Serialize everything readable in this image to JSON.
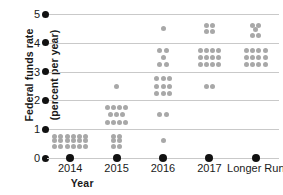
{
  "chart_data": {
    "type": "scatter",
    "title": "",
    "subtitle": "",
    "xlabel": "Year",
    "ylabel": "Federal funds rate (percent per year)",
    "ylabel_line1": "Federal funds rate",
    "ylabel_line2": "(percent per year)",
    "categories": [
      "2014",
      "2015",
      "2016",
      "2017",
      "Longer Run"
    ],
    "ylim": [
      0,
      5
    ],
    "yticks": [
      0,
      1,
      2,
      3,
      4,
      5
    ],
    "ytick_labels": [
      "0",
      "1",
      "2",
      "3",
      "4",
      "5"
    ],
    "grid": true,
    "legend": "none",
    "dot_color": "#a8a8a8",
    "axis_marker_color": "#111111",
    "gridline_color": "#c9c9c9",
    "series": [
      {
        "name": "2014",
        "category_index": 0,
        "rows": [
          {
            "value": 0.75,
            "count": 6
          },
          {
            "value": 0.6,
            "count": 6
          },
          {
            "value": 0.4,
            "count": 6
          }
        ]
      },
      {
        "name": "2015",
        "category_index": 1,
        "rows": [
          {
            "value": 2.5,
            "count": 1
          },
          {
            "value": 1.75,
            "count": 4
          },
          {
            "value": 1.5,
            "count": 3
          },
          {
            "value": 1.25,
            "count": 4
          },
          {
            "value": 0.75,
            "count": 2
          },
          {
            "value": 0.6,
            "count": 2
          },
          {
            "value": 0.4,
            "count": 2
          }
        ]
      },
      {
        "name": "2016",
        "category_index": 2,
        "rows": [
          {
            "value": 4.5,
            "count": 1
          },
          {
            "value": 3.75,
            "count": 2
          },
          {
            "value": 3.5,
            "count": 1
          },
          {
            "value": 3.25,
            "count": 2
          },
          {
            "value": 2.75,
            "count": 3
          },
          {
            "value": 2.5,
            "count": 3
          },
          {
            "value": 2.25,
            "count": 3
          },
          {
            "value": 1.5,
            "count": 2
          },
          {
            "value": 0.6,
            "count": 1
          }
        ]
      },
      {
        "name": "2017",
        "category_index": 3,
        "rows": [
          {
            "value": 4.6,
            "count": 2
          },
          {
            "value": 4.4,
            "count": 2
          },
          {
            "value": 3.75,
            "count": 4
          },
          {
            "value": 3.5,
            "count": 4
          },
          {
            "value": 3.25,
            "count": 4
          },
          {
            "value": 2.5,
            "count": 2
          }
        ]
      },
      {
        "name": "Longer Run",
        "category_index": 4,
        "rows": [
          {
            "value": 4.6,
            "count": 2
          },
          {
            "value": 4.45,
            "count": 1
          },
          {
            "value": 4.25,
            "count": 2
          },
          {
            "value": 3.75,
            "count": 4
          },
          {
            "value": 3.5,
            "count": 4
          },
          {
            "value": 3.25,
            "count": 4
          }
        ]
      }
    ]
  }
}
